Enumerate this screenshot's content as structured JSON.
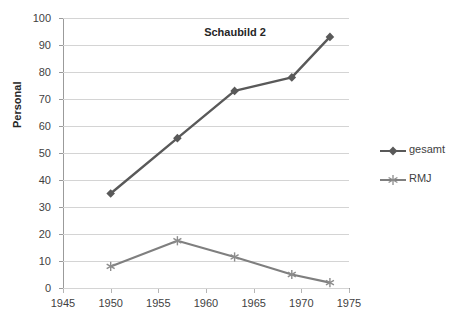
{
  "chart_data": {
    "type": "line",
    "title": "Schaubild 2",
    "xlabel": "",
    "ylabel": "Personal",
    "xlim": [
      1945,
      1975
    ],
    "ylim": [
      0,
      100
    ],
    "xticks": [
      1945,
      1950,
      1955,
      1960,
      1965,
      1970,
      1975
    ],
    "yticks": [
      0,
      10,
      20,
      30,
      40,
      50,
      60,
      70,
      80,
      90,
      100
    ],
    "grid": "horizontal",
    "legend_position": "right",
    "series": [
      {
        "name": "gesamt",
        "marker": "diamond",
        "color": "#595959",
        "x": [
          1950,
          1957,
          1963,
          1969,
          1973
        ],
        "values": [
          35,
          55.5,
          73,
          78,
          93
        ]
      },
      {
        "name": "RMJ",
        "marker": "asterisk",
        "color": "#7f7f7f",
        "x": [
          1950,
          1957,
          1963,
          1969,
          1973
        ],
        "values": [
          8,
          17.5,
          11.5,
          5,
          2
        ]
      }
    ]
  },
  "axis": {
    "y_tick_labels": [
      "100",
      "90",
      "80",
      "70",
      "60",
      "50",
      "40",
      "30",
      "20",
      "10",
      "0"
    ],
    "x_tick_labels": [
      "1945",
      "1950",
      "1955",
      "1960",
      "1965",
      "1970",
      "1975"
    ],
    "y_title": "Personal"
  },
  "title": {
    "text": "Schaubild 2"
  },
  "legend": {
    "items": [
      {
        "label": "gesamt"
      },
      {
        "label": "RMJ"
      }
    ]
  }
}
